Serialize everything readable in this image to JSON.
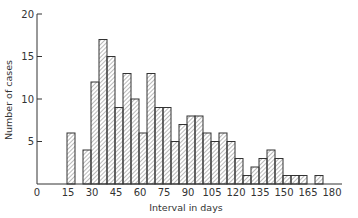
{
  "chart_data": {
    "type": "bar",
    "title": "",
    "xlabel": "Interval in days",
    "ylabel": "Number of cases",
    "xlim": [
      0,
      180
    ],
    "ylim": [
      0,
      20
    ],
    "x_ticks": [
      0,
      15,
      30,
      45,
      60,
      75,
      90,
      105,
      120,
      135,
      150,
      165,
      180
    ],
    "y_ticks": [
      5,
      10,
      15,
      20
    ],
    "y_tick_labels": [
      "5",
      "10",
      "15",
      "20"
    ],
    "x_tick_labels": [
      "0",
      "15",
      "30",
      "45",
      "60",
      "75",
      "90",
      "105",
      "120",
      "135",
      "150",
      "165",
      "180"
    ],
    "bin_width": 5,
    "grid": false,
    "legend": null,
    "fill_pattern": "diagonal-hatch",
    "bins": [
      {
        "start": 15,
        "end": 20,
        "value": 6
      },
      {
        "start": 20,
        "end": 25,
        "value": 0
      },
      {
        "start": 25,
        "end": 30,
        "value": 4
      },
      {
        "start": 30,
        "end": 35,
        "value": 12
      },
      {
        "start": 35,
        "end": 40,
        "value": 17
      },
      {
        "start": 40,
        "end": 45,
        "value": 15
      },
      {
        "start": 45,
        "end": 50,
        "value": 9
      },
      {
        "start": 50,
        "end": 55,
        "value": 13
      },
      {
        "start": 55,
        "end": 60,
        "value": 10
      },
      {
        "start": 60,
        "end": 65,
        "value": 6
      },
      {
        "start": 65,
        "end": 70,
        "value": 13
      },
      {
        "start": 70,
        "end": 75,
        "value": 9
      },
      {
        "start": 75,
        "end": 80,
        "value": 9
      },
      {
        "start": 80,
        "end": 85,
        "value": 5
      },
      {
        "start": 85,
        "end": 90,
        "value": 7
      },
      {
        "start": 90,
        "end": 95,
        "value": 8
      },
      {
        "start": 95,
        "end": 100,
        "value": 8
      },
      {
        "start": 100,
        "end": 105,
        "value": 6
      },
      {
        "start": 105,
        "end": 110,
        "value": 5
      },
      {
        "start": 110,
        "end": 115,
        "value": 6
      },
      {
        "start": 115,
        "end": 120,
        "value": 5
      },
      {
        "start": 120,
        "end": 125,
        "value": 3
      },
      {
        "start": 125,
        "end": 130,
        "value": 1
      },
      {
        "start": 130,
        "end": 135,
        "value": 2
      },
      {
        "start": 135,
        "end": 140,
        "value": 3
      },
      {
        "start": 140,
        "end": 145,
        "value": 4
      },
      {
        "start": 145,
        "end": 150,
        "value": 3
      },
      {
        "start": 150,
        "end": 155,
        "value": 1
      },
      {
        "start": 155,
        "end": 160,
        "value": 1
      },
      {
        "start": 160,
        "end": 165,
        "value": 1
      },
      {
        "start": 165,
        "end": 170,
        "value": 0
      },
      {
        "start": 170,
        "end": 175,
        "value": 1
      }
    ]
  },
  "colors": {
    "line": "#333333",
    "hatch": "#555555",
    "background": "#ffffff"
  }
}
